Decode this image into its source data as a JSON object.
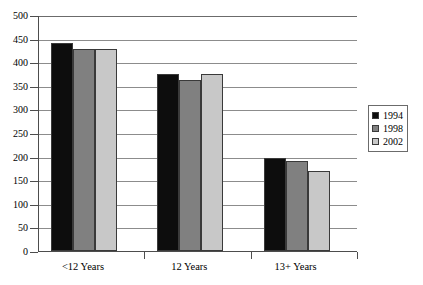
{
  "chart_data": {
    "type": "bar",
    "title": "",
    "subtitle": "",
    "xlabel": "",
    "ylabel": "",
    "categories": [
      "<12 Years",
      "12 Years",
      "13+ Years"
    ],
    "series": [
      {
        "name": "1994",
        "color": "#0d0d0d",
        "values": [
          440,
          375,
          198
        ]
      },
      {
        "name": "1998",
        "color": "#808080",
        "values": [
          428,
          363,
          190
        ]
      },
      {
        "name": "2002",
        "color": "#c8c8c8",
        "values": [
          428,
          375,
          169
        ]
      }
    ],
    "ylim": [
      0,
      500
    ],
    "ytick_step": 50,
    "yticks": [
      0,
      50,
      100,
      150,
      200,
      250,
      300,
      350,
      400,
      450,
      500
    ],
    "ytick_labels": [
      "0",
      "50",
      "100",
      "150",
      "200",
      "250",
      "300",
      "350",
      "400",
      "450",
      "500"
    ],
    "grid": "horizontal",
    "legend_position": "right",
    "legend_entries": [
      "1994",
      "1998",
      "2002"
    ],
    "bar_outline_color": "#3a3a3a",
    "gridline_color": "#8c8c8c",
    "axis_color": "#4d4d4d",
    "background_color": "#ffffff"
  }
}
